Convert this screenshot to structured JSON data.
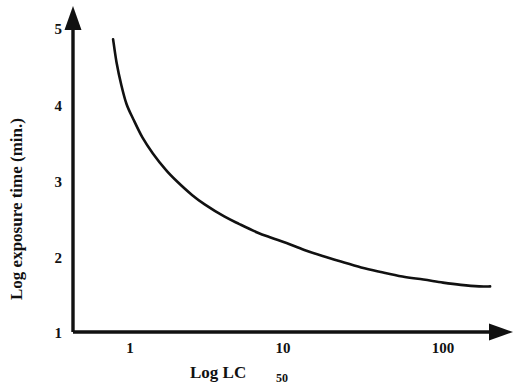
{
  "chart_data": {
    "type": "line",
    "title": "",
    "subtitle": "",
    "xlabel": "Log LC50",
    "xlabel_base": "Log LC",
    "xlabel_subscript": "50",
    "ylabel": "Log exposure time (min.)",
    "x_scale": "log",
    "y_scale": "linear",
    "xlim": [
      0.55,
      250
    ],
    "ylim": [
      1,
      5.1
    ],
    "xticks": [
      1,
      10,
      100
    ],
    "xtick_labels": [
      "1",
      "10",
      "100"
    ],
    "yticks": [
      1,
      2,
      3,
      4,
      5
    ],
    "ytick_labels": [
      "1",
      "2",
      "3",
      "4",
      "5"
    ],
    "grid": false,
    "legend": false,
    "legend_position": "none",
    "axis_style": "arrow-headed L-shaped axes, no tick marks",
    "line_color": "#111111",
    "background_color": "#ffffff",
    "series": [
      {
        "name": "Log exposure time vs Log LC50",
        "color": "#111111",
        "x": [
          0.78,
          0.82,
          0.88,
          0.95,
          1.05,
          1.2,
          1.4,
          1.7,
          2.0,
          2.5,
          3.0,
          4.0,
          5.0,
          6.5,
          8.0,
          10.0,
          13.0,
          17.0,
          22.0,
          30.0,
          40.0,
          55.0,
          75.0,
          100.0,
          130.0,
          170.0,
          200.0
        ],
        "y": [
          4.85,
          4.55,
          4.25,
          4.0,
          3.8,
          3.56,
          3.35,
          3.13,
          2.98,
          2.8,
          2.68,
          2.52,
          2.42,
          2.31,
          2.24,
          2.17,
          2.08,
          2.0,
          1.93,
          1.85,
          1.79,
          1.73,
          1.69,
          1.65,
          1.62,
          1.6,
          1.6
        ]
      }
    ],
    "annotations": []
  },
  "axes": {
    "y_title": "Log exposure time (min.)",
    "x_title_base": "Log LC",
    "x_title_subscript": "50",
    "y_tick_labels": [
      "5",
      "4",
      "3",
      "2",
      "1"
    ],
    "x_tick_labels": [
      "1",
      "10",
      "100"
    ]
  }
}
